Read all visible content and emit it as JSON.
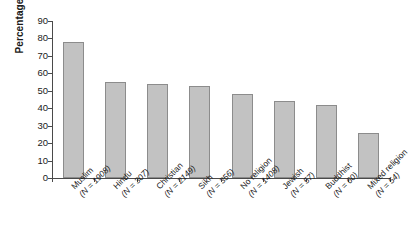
{
  "chart_data": {
    "type": "bar",
    "title": "",
    "xlabel": "",
    "ylabel": "Percentage",
    "ylim": [
      0,
      90
    ],
    "ytick_step": 10,
    "yticks": [
      90,
      80,
      70,
      60,
      50,
      40,
      30,
      20,
      10,
      0
    ],
    "grid": false,
    "legend": null,
    "categories": [
      "Muslim",
      "Hindu",
      "Christian",
      "Sikh",
      "No religion",
      "Jewish",
      "Buddhist",
      "Mixed religion"
    ],
    "category_counts": [
      "(N = 1908)",
      "(N = 307)",
      "(N = 2149)",
      "(N = 356)",
      "(N = 1408)",
      "(N = 57)",
      "(N = 60)",
      "(N = 54)"
    ],
    "values": [
      78,
      55,
      54,
      53,
      48,
      44,
      42,
      26
    ],
    "bar_color": "#c2c2c2",
    "bar_border_color": "#8c8c8c",
    "axis_color": "#4a4a4a",
    "background": "#ffffff"
  }
}
